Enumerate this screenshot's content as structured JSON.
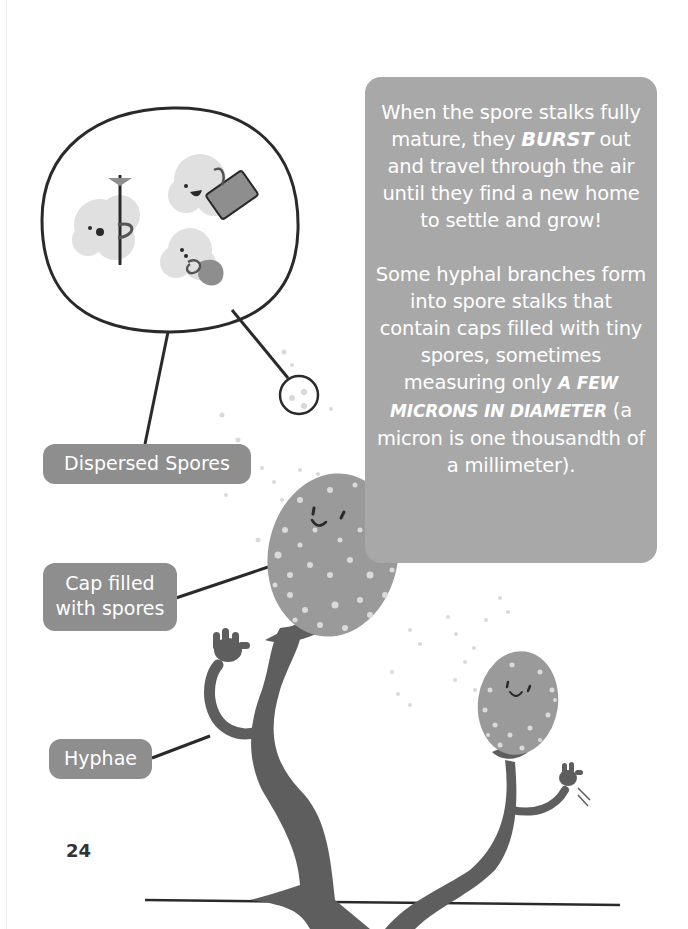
{
  "page": {
    "page_number": "24",
    "background_color": "#ffffff"
  },
  "infobox": {
    "background_color": "#a8a8a8",
    "text_color": "#ffffff",
    "paragraph_1": {
      "part_1": "When the spore stalks fully mature, they ",
      "emphasis": "BURST",
      "part_2": " out and travel through the air until they find a new home to settle and grow!"
    },
    "paragraph_2": {
      "part_1": "Some hyphal branches form into spore stalks that contain caps filled with tiny spores, sometimes measuring only ",
      "emphasis": "A FEW MICRONS IN DIAMETER",
      "part_2": " (a micron is one thousandth of a millimeter)."
    }
  },
  "labels": {
    "dispersed_spores": "Dispersed Spores",
    "cap_line_1": "Cap filled",
    "cap_line_2": "with spores",
    "hyphae": "Hyphae"
  },
  "colors": {
    "pill": "#8e8e8e",
    "stalk": "#5e5e5e",
    "cap": "#9a9a9a",
    "spore_dot": "#d8d8d8",
    "outline": "#2a2a2a",
    "spore_cloud": "#e0e0e0"
  },
  "illustration": {
    "magnifier_contents": [
      "spore-with-hiking-stick-icon",
      "spore-with-suitcase-icon",
      "spore-with-backpack-icon"
    ],
    "characters": [
      "large-spore-stalk-waving",
      "small-spore-stalk-waving"
    ]
  }
}
